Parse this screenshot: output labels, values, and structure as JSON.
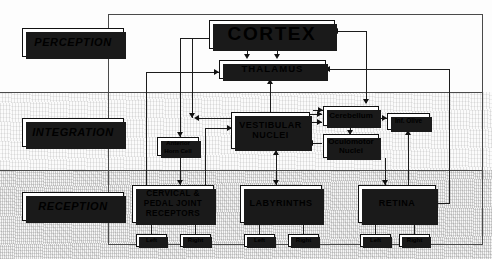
{
  "diagram": {
    "levels": [
      {
        "key": "perception",
        "label": "PERCEPTION"
      },
      {
        "key": "integration",
        "label": "INTEGRATION"
      },
      {
        "key": "reception",
        "label": "RECEPTION"
      }
    ],
    "nodes": {
      "cortex": "CORTEX",
      "thalamus": "THALAMUS",
      "vestibular": "VESTIBULAR NUCLEI",
      "cerebellum": "Cerebellum",
      "oculomotor": "Oculomotor Nuclei",
      "inf_olive": "Inf. Olive",
      "anterior": "Anterior Horn Cell",
      "cervical": "CERVICAL & PEDAL JOINT RECEPTORS",
      "labyrinths": "LABYRINTHS",
      "retina": "RETINA"
    },
    "side_labels": {
      "cervical_left": "Left",
      "cervical_right": "Right",
      "labyrinths_left": "Left",
      "labyrinths_right": "Right",
      "retina_left": "Left",
      "retina_right": "Right"
    },
    "colors": {
      "ink": "#111111",
      "box_fill": "#ffffff",
      "shadow": "#1a1a1a",
      "frame": "#4a4a4a",
      "band_perception": "#fdfdfd",
      "band_integration": "#fbfbfb",
      "band_reception": "#f7f7f7"
    }
  }
}
